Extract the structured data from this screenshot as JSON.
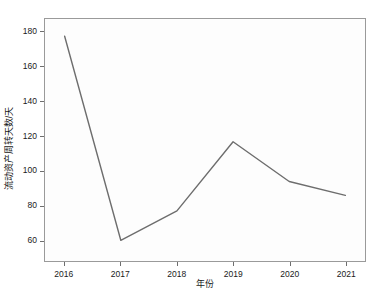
{
  "chart_data": {
    "type": "line",
    "title": "",
    "xlabel": "年份",
    "ylabel": "流动资产周转天数/天",
    "x": [
      "2016",
      "2017",
      "2018",
      "2019",
      "2020",
      "2021"
    ],
    "categories": [
      "2016",
      "2017",
      "2018",
      "2019",
      "2020",
      "2021"
    ],
    "values": [
      178,
      60,
      77,
      117,
      94,
      86
    ],
    "series": [
      {
        "name": "流动资产周转天数",
        "values": [
          178,
          60,
          77,
          117,
          94,
          86
        ]
      }
    ],
    "xtick_labels": [
      "2016",
      "2017",
      "2018",
      "2019",
      "2020",
      "2021"
    ],
    "ytick_labels": [
      "60",
      "80",
      "100",
      "120",
      "140",
      "160",
      "180"
    ],
    "ytick_values": [
      60,
      80,
      100,
      120,
      140,
      160,
      180
    ],
    "ylim": [
      48,
      188
    ],
    "xlim": [
      2015.65,
      2021.35
    ],
    "grid": false,
    "legend": "none",
    "line_color": "#6d6d6d",
    "frame_color": "#9a9a9a",
    "background_color": "#fdfdfd",
    "text_color": "#1a1a1a"
  }
}
